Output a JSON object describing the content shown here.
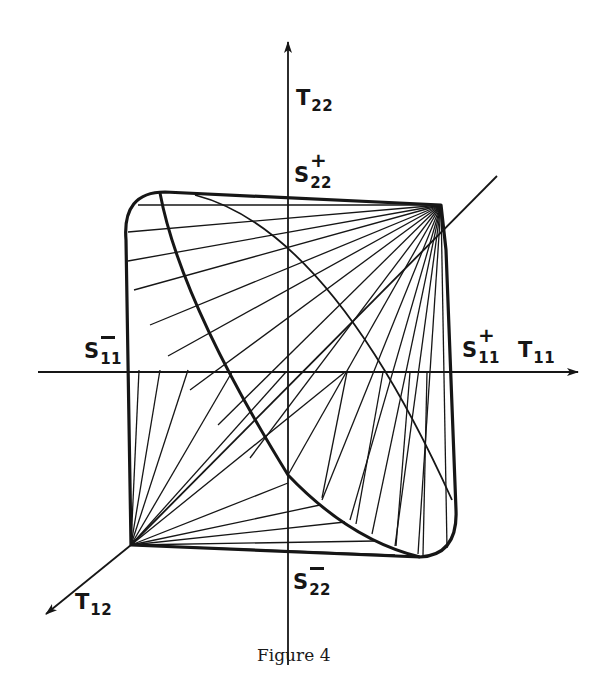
{
  "figure": {
    "caption": "Figure 4",
    "axes": {
      "t11": {
        "base": "T",
        "sub": "11"
      },
      "t22": {
        "base": "T",
        "sub": "22"
      },
      "t12": {
        "base": "T",
        "sub": "12"
      }
    },
    "points": {
      "s11_plus": {
        "base": "S",
        "sub": "11",
        "sign": "+"
      },
      "s11_minus": {
        "base": "S",
        "sub": "11",
        "sign": "−"
      },
      "s22_plus": {
        "base": "S",
        "sub": "22",
        "sign": "+"
      },
      "s22_minus": {
        "base": "S",
        "sub": "22",
        "sign": "−"
      }
    },
    "colors": {
      "ink": "#161616",
      "paper": "#ffffff"
    }
  }
}
